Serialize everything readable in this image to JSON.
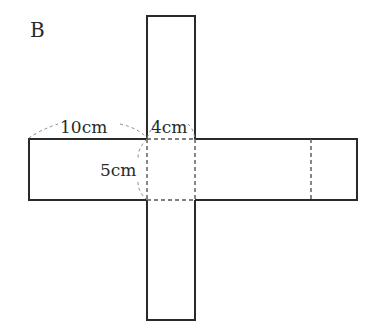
{
  "figure": {
    "label": "B",
    "colors": {
      "line": "#2a2a2a",
      "dashed": "#555555",
      "bracket": "#8a8a8a",
      "background": "#ffffff"
    },
    "dimensions": {
      "length": "10cm",
      "width": "4cm",
      "height": "5cm"
    }
  }
}
